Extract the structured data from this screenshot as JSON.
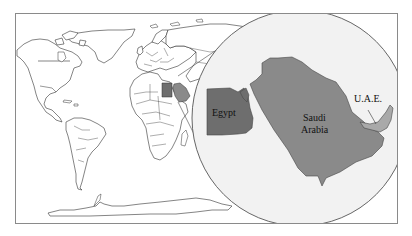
{
  "figure": {
    "type": "world-map-with-inset",
    "frame": {
      "x": 15,
      "y": 13,
      "width": 383,
      "height": 211
    },
    "colors": {
      "background": "#ffffff",
      "frame_stroke": "#8a8a8a",
      "land_fill": "#ffffff",
      "land_stroke": "#333333",
      "inset_fill": "#f2f2f2",
      "inset_stroke": "#555555",
      "egypt_fill": "#6e6e6e",
      "saudi_fill": "#8a8a8a",
      "uae_fill": "#a9a9a9"
    },
    "inset": {
      "shape": "circle",
      "center_x": 300,
      "center_y": 118,
      "radius": 108
    },
    "labels": {
      "egypt": "Egypt",
      "saudi_line1": "Saudi",
      "saudi_line2": "Arabia",
      "uae": "U.A.E."
    },
    "highlighted_countries": [
      "Egypt",
      "Saudi Arabia",
      "U.A.E."
    ]
  }
}
